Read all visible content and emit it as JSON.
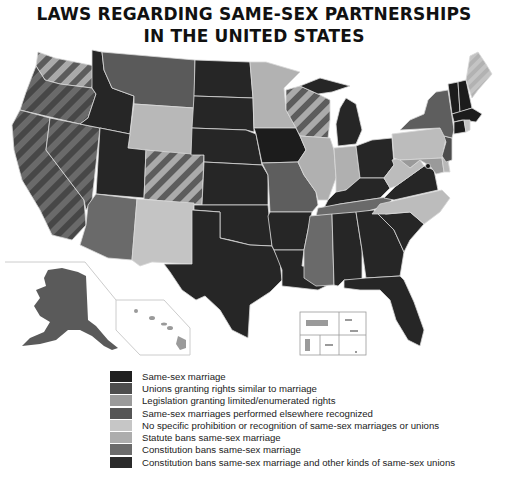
{
  "title": {
    "line1": "LAWS REGARDING SAME-SEX PARTNERSHIPS",
    "line2": "IN THE UNITED STATES"
  },
  "colors": {
    "same_sex_marriage": "#1f1f1f",
    "unions_similar": "#4d4d4d",
    "limited_rights": "#9a9a9a",
    "recognized_elsewhere": "#5a5a5a",
    "no_prohibition": "#c4c4c4",
    "statute_ban": "#b0b0b0",
    "constitution_ban_marriage": "#6e6e6e",
    "constitution_ban_all": "#2b2b2b",
    "border": "#d8d8d8"
  },
  "legend": {
    "items": [
      {
        "label": "Same-sex marriage",
        "color": "#1f1f1f"
      },
      {
        "label": "Unions granting rights similar to marriage",
        "color": "#4d4d4d"
      },
      {
        "label": "Legislation granting limited/enumerated rights",
        "color": "#9a9a9a"
      },
      {
        "label": "Same-sex marriages performed elsewhere recognized",
        "color": "#555555"
      },
      {
        "label": "No specific prohibition or recognition of same-sex marriages or unions",
        "color": "#c6c6c6"
      },
      {
        "label": "Statute bans same-sex marriage",
        "color": "#adadad"
      },
      {
        "label": "Constitution bans same-sex marriage",
        "color": "#6b6b6b"
      },
      {
        "label": "Constitution bans same-sex marriage and other kinds of same-sex unions",
        "color": "#2a2a2a"
      }
    ]
  },
  "map": {
    "insets": [
      "Alaska",
      "Hawaii",
      "US territories"
    ]
  }
}
